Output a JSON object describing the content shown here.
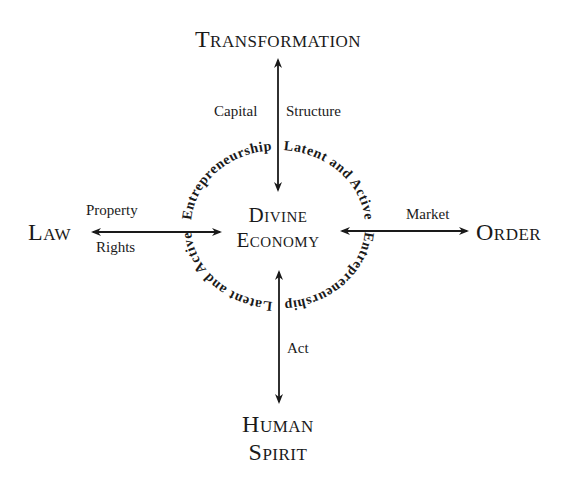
{
  "diagram": {
    "center": {
      "line1": "Divine",
      "line2": "Economy"
    },
    "nodes": {
      "top": "Transformation",
      "left": "Law",
      "right": "Order",
      "bottom_line1": "Human",
      "bottom_line2": "Spirit"
    },
    "edge_labels": {
      "top_left": "Capital",
      "top_right": "Structure",
      "left_top": "Property",
      "left_bottom": "Rights",
      "right_top": "Market",
      "bottom_right": "Act"
    },
    "ring_text": {
      "top_left": "Entrepreneurship",
      "top_right": "Latent and Active",
      "bottom_right": "Entrepreneurship",
      "bottom_left": "Latent and Active"
    },
    "colors": {
      "ink": "#1a1a1a",
      "background": "#ffffff"
    }
  }
}
